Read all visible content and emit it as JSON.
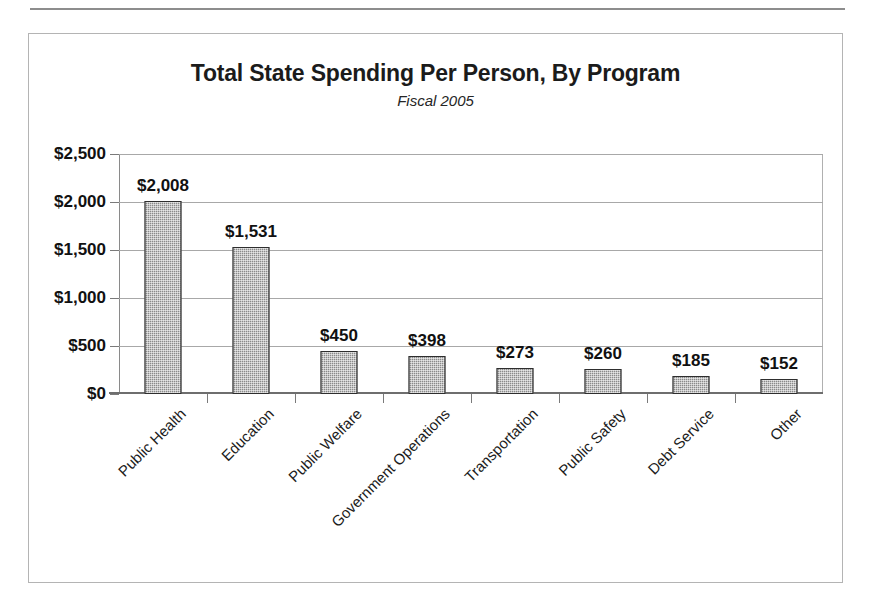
{
  "chart_data": {
    "type": "bar",
    "title": "Total State Spending Per Person, By Program",
    "subtitle": "Fiscal 2005",
    "xlabel": "",
    "ylabel": "",
    "ylim": [
      0,
      2500
    ],
    "ytick_step": 500,
    "ytick_labels": [
      "$0",
      "$500",
      "$1,000",
      "$1,500",
      "$2,000",
      "$2,500"
    ],
    "ytick_values": [
      0,
      500,
      1000,
      1500,
      2000,
      2500
    ],
    "grid": true,
    "legend": false,
    "currency_prefix": "$",
    "bar_color": "#8a8a8a",
    "bar_border_color": "#2e2e2e",
    "categories": [
      "Public Health",
      "Education",
      "Public Welfare",
      "Government Operations",
      "Transportation",
      "Public Safety",
      "Debt Service",
      "Other"
    ],
    "values": [
      2008,
      1531,
      450,
      398,
      273,
      260,
      185,
      152
    ],
    "data_labels": [
      "$2,008",
      "$1,531",
      "$450",
      "$398",
      "$273",
      "$260",
      "$185",
      "$152"
    ]
  }
}
